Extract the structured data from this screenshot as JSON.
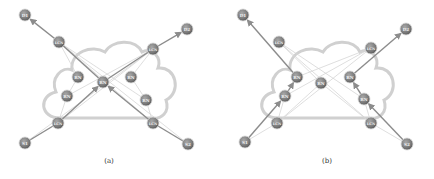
{
  "figure": {
    "panels": [
      {
        "id": "a",
        "caption": "(a)",
        "offset_x": 0,
        "nodes": [
          {
            "id": "D1",
            "label": "D1",
            "x": 25,
            "y": 15,
            "type": "endpoint"
          },
          {
            "id": "D2",
            "label": "D2",
            "x": 187,
            "y": 29,
            "type": "endpoint"
          },
          {
            "id": "LCN_TL",
            "label": "LCN",
            "x": 59,
            "y": 42,
            "type": "lcn"
          },
          {
            "id": "LCN_TR",
            "label": "LCN",
            "x": 153,
            "y": 49,
            "type": "lcn"
          },
          {
            "id": "RN_C",
            "label": "RN",
            "x": 103,
            "y": 82,
            "type": "rn"
          },
          {
            "id": "RN_LT",
            "label": "RN",
            "x": 78,
            "y": 77,
            "type": "rn"
          },
          {
            "id": "RN_LB",
            "label": "RN",
            "x": 67,
            "y": 96,
            "type": "rn"
          },
          {
            "id": "RN_RT",
            "label": "RN",
            "x": 131,
            "y": 77,
            "type": "rn"
          },
          {
            "id": "RN_RB",
            "label": "RN",
            "x": 146,
            "y": 100,
            "type": "rn"
          },
          {
            "id": "LCN_BL",
            "label": "LCN",
            "x": 58,
            "y": 123,
            "type": "lcn"
          },
          {
            "id": "LCN_BR",
            "label": "LCN",
            "x": 153,
            "y": 123,
            "type": "lcn"
          },
          {
            "id": "S1",
            "label": "S1",
            "x": 25,
            "y": 143,
            "type": "endpoint"
          },
          {
            "id": "S2",
            "label": "S2",
            "x": 188,
            "y": 144,
            "type": "endpoint"
          }
        ],
        "paths": [
          {
            "from": "S1",
            "via": [
              "LCN_BL"
            ],
            "to": "RN_C",
            "arrow": true
          },
          {
            "from": "RN_C",
            "via": [
              "LCN_TL"
            ],
            "to": "D1",
            "arrow": true
          },
          {
            "from": "S2",
            "via": [
              "LCN_BR"
            ],
            "to": "RN_C",
            "arrow": true
          },
          {
            "from": "RN_C",
            "via": [
              "LCN_TR"
            ],
            "to": "D2",
            "arrow": true
          }
        ],
        "faint_links": [
          [
            "LCN_TL",
            "RN_LT"
          ],
          [
            "LCN_TL",
            "RN_RB"
          ],
          [
            "LCN_TR",
            "RN_LB"
          ],
          [
            "LCN_TR",
            "RN_RT"
          ],
          [
            "LCN_BL",
            "RN_LB"
          ],
          [
            "LCN_BL",
            "LCN_TR"
          ],
          [
            "LCN_BR",
            "RN_RB"
          ],
          [
            "LCN_BR",
            "LCN_TL"
          ],
          [
            "RN_LT",
            "RN_LB"
          ],
          [
            "RN_RT",
            "RN_RB"
          ],
          [
            "S1",
            "LCN_TR"
          ],
          [
            "S2",
            "LCN_TL"
          ]
        ]
      },
      {
        "id": "b",
        "caption": "(b)",
        "offset_x": 0,
        "nodes": [
          {
            "id": "D1",
            "label": "D1",
            "x": 243,
            "y": 15,
            "type": "endpoint"
          },
          {
            "id": "D2",
            "label": "D2",
            "x": 406,
            "y": 29,
            "type": "endpoint"
          },
          {
            "id": "LCN_TL",
            "label": "LCN",
            "x": 279,
            "y": 42,
            "type": "lcn"
          },
          {
            "id": "LCN_TR",
            "label": "LCN",
            "x": 371,
            "y": 48,
            "type": "lcn"
          },
          {
            "id": "RN_UL",
            "label": "RN",
            "x": 297,
            "y": 77,
            "type": "rn"
          },
          {
            "id": "RN_C",
            "label": "RN",
            "x": 321,
            "y": 83,
            "type": "rn"
          },
          {
            "id": "RN_UR",
            "label": "RN",
            "x": 350,
            "y": 77,
            "type": "rn"
          },
          {
            "id": "RN_LL",
            "label": "RN",
            "x": 285,
            "y": 96,
            "type": "rn"
          },
          {
            "id": "RN_LR",
            "label": "RN",
            "x": 364,
            "y": 99,
            "type": "rn"
          },
          {
            "id": "LCN_BL",
            "label": "LCN",
            "x": 277,
            "y": 123,
            "type": "lcn"
          },
          {
            "id": "LCN_BR",
            "label": "LCN",
            "x": 371,
            "y": 123,
            "type": "lcn"
          },
          {
            "id": "S1",
            "label": "S1",
            "x": 245,
            "y": 142,
            "type": "endpoint"
          },
          {
            "id": "S2",
            "label": "S2",
            "x": 407,
            "y": 144,
            "type": "endpoint"
          }
        ],
        "paths": [
          {
            "from": "S1",
            "via": [],
            "to": "RN_LL",
            "arrow": true
          },
          {
            "from": "RN_LL",
            "via": [],
            "to": "RN_UL",
            "arrow": true
          },
          {
            "from": "RN_UL",
            "via": [],
            "to": "D1",
            "arrow": true
          },
          {
            "from": "S2",
            "via": [],
            "to": "RN_LR",
            "arrow": true
          },
          {
            "from": "RN_LR",
            "via": [],
            "to": "RN_UR",
            "arrow": true
          },
          {
            "from": "RN_UR",
            "via": [],
            "to": "D2",
            "arrow": true
          }
        ],
        "faint_links": [
          [
            "LCN_TL",
            "RN_C"
          ],
          [
            "RN_C",
            "LCN_BR"
          ],
          [
            "LCN_TL",
            "RN_LR"
          ],
          [
            "LCN_TR",
            "RN_UL"
          ],
          [
            "LCN_TR",
            "RN_LL"
          ],
          [
            "LCN_BL",
            "RN_C"
          ],
          [
            "LCN_BL",
            "LCN_TR"
          ],
          [
            "LCN_BR",
            "RN_LR"
          ],
          [
            "LCN_BL",
            "RN_LL"
          ],
          [
            "S1",
            "LCN_BL"
          ],
          [
            "S2",
            "LCN_BR"
          ],
          [
            "LCN_TL",
            "LCN_BR"
          ]
        ]
      }
    ],
    "colors": {
      "node_fill": "#8a8a8a",
      "node_dark": "#5e5e5e",
      "node_text": "#f2f2f2",
      "cloud_stroke": "#cfcfcf",
      "path_stroke": "#8c8c8c",
      "faint_stroke": "#d6d6d6"
    }
  }
}
